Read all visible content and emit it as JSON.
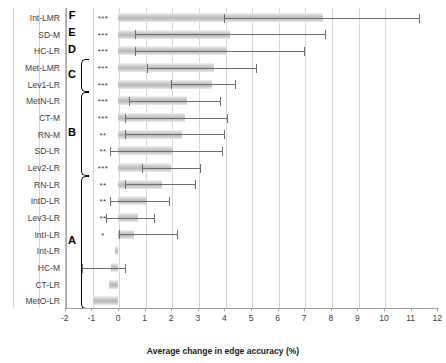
{
  "chart_data": {
    "type": "bar",
    "orientation": "horizontal",
    "title": "",
    "xlabel": "Average change in edge accuracy (%)",
    "ylabel": "",
    "xlim": [
      -2,
      12
    ],
    "xticks": [
      "-2",
      "-1",
      "0",
      "1",
      "2",
      "3",
      "4",
      "5",
      "6",
      "7",
      "8",
      "9",
      "10",
      "11",
      "12"
    ],
    "grid": true,
    "legend": "none",
    "categories": [
      "Int-LMR",
      "SD-M",
      "HC-LR",
      "Met-LMR",
      "Lev1-LR",
      "MetN-LR",
      "CT-M",
      "RN-M",
      "SD-LR",
      "Lev2-LR",
      "RN-LR",
      "IntD-LR",
      "Lev3-LR",
      "IntI-LR",
      "Int-LR",
      "HC-M",
      "CT-LR",
      "MetO-LR"
    ],
    "values": [
      7.7,
      4.2,
      4.1,
      3.6,
      3.55,
      2.6,
      2.5,
      2.4,
      2.05,
      2.0,
      1.65,
      1.1,
      0.75,
      0.6,
      -0.1,
      -0.25,
      -0.35,
      -0.95
    ],
    "err_low": [
      4.0,
      0.65,
      0.65,
      1.1,
      2.0,
      0.4,
      0.25,
      0.25,
      -0.3,
      0.9,
      0.25,
      -0.3,
      -0.45,
      0.05,
      null,
      -1.35,
      null,
      null
    ],
    "err_high": [
      11.3,
      7.8,
      7.0,
      5.2,
      4.4,
      3.85,
      4.1,
      4.0,
      3.9,
      3.1,
      2.9,
      1.9,
      1.35,
      2.2,
      null,
      0.25,
      null,
      null
    ],
    "significance": [
      "***",
      "***",
      "***",
      "***",
      "***",
      "***",
      "***",
      "**",
      "**",
      "***",
      "**",
      "**",
      "**",
      "*",
      "",
      "",
      "",
      ""
    ],
    "group_brackets": [
      {
        "label": "F",
        "from": "Int-LMR",
        "to": "Int-LMR"
      },
      {
        "label": "E",
        "from": "SD-M",
        "to": "SD-M"
      },
      {
        "label": "D",
        "from": "HC-LR",
        "to": "HC-LR"
      },
      {
        "label": "C",
        "from": "Met-LMR",
        "to": "Lev1-LR"
      },
      {
        "label": "B",
        "from": "MetN-LR",
        "to": "Lev2-LR"
      },
      {
        "label": "A",
        "from": "RN-LR",
        "to": "MetO-LR"
      }
    ]
  }
}
